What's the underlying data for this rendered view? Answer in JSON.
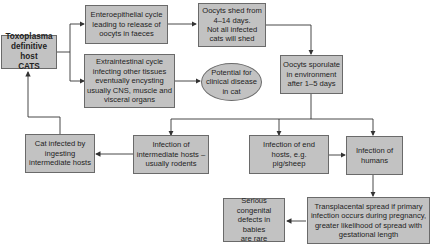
{
  "diagram": {
    "nodes": {
      "cats": "Toxoplasma\ndefinitive host\nCATS",
      "entero": "Enteroepithelial cycle\nleading to release of\noocyts in faeces",
      "shed": "Oocyts shed from\n4–14 days.\nNot all infected\ncats will shed",
      "extra": "Extraintestinal cycle\ninfecting other tissues\neventually encysting\nusually CNS, muscle and\nvisceral organs",
      "potential": "Potential for\nclinical disease\nin cat",
      "sporulate": "Oocyts sporulate\nin environment\nafter 1–5 days",
      "cat_infected": "Cat infected by\ningesting\nintermediate hosts",
      "intermediate": "Infection of\nintermediate hosts –\nusually rodents",
      "end_hosts": "Infection of end\nhosts, e.g.\npig/sheep",
      "humans": "Infection of\nhumans",
      "transplacental": "Transplacental spread if primary\ninfection occurs during pregnancy,\ngreater likelihood of spread with\ngestational length",
      "congenital": "Serious\ncongenital\ndefects in babies\nare rare"
    },
    "colors": {
      "box_fill": "#c2c2c2",
      "border": "#6a6a6a",
      "line": "#333333"
    }
  }
}
